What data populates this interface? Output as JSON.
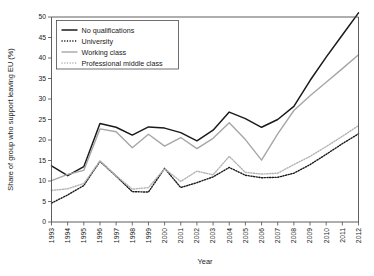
{
  "chart_data": {
    "type": "line",
    "title": "",
    "xlabel": "Year",
    "ylabel": "Share of group who support leaving EU (%)",
    "xlim": [
      1993,
      2012
    ],
    "ylim": [
      0,
      50
    ],
    "yticks": [
      0,
      5,
      10,
      15,
      20,
      25,
      30,
      35,
      40,
      45,
      50
    ],
    "grid": false,
    "legend_position": "top-left",
    "categories": [
      1993,
      1994,
      1995,
      1996,
      1997,
      1998,
      1999,
      2000,
      2001,
      2002,
      2003,
      2004,
      2005,
      2006,
      2007,
      2008,
      2009,
      2010,
      2011,
      2012
    ],
    "x": [
      "1993",
      "1994",
      "1995",
      "1996",
      "1997",
      "1998",
      "1999",
      "2000",
      "2001",
      "2002",
      "2003",
      "2004",
      "2005",
      "2006",
      "2007",
      "2008",
      "2009",
      "2010",
      "2011",
      "2012"
    ],
    "series": [
      {
        "name": "No qualifications",
        "style": "solid",
        "color": "#1a1a1a",
        "width": 1.5,
        "values": [
          13.7,
          11.3,
          13.5,
          24.0,
          23.1,
          21.2,
          23.2,
          22.9,
          21.8,
          19.8,
          22.4,
          26.8,
          25.2,
          23.1,
          25.0,
          28.2,
          34.5,
          40.2,
          45.6,
          51.0
        ]
      },
      {
        "name": "University",
        "style": "dotted",
        "color": "#1a1a1a",
        "width": 1.4,
        "values": [
          4.6,
          6.6,
          8.9,
          14.8,
          11.2,
          7.4,
          7.3,
          13.1,
          8.4,
          9.6,
          11.0,
          13.3,
          11.4,
          10.8,
          10.9,
          11.9,
          14.0,
          16.5,
          19.1,
          21.5
        ]
      },
      {
        "name": "Working class",
        "style": "solid",
        "color": "#a6a6a6",
        "width": 1.4,
        "values": [
          10.1,
          11.6,
          12.6,
          22.7,
          22.0,
          18.1,
          21.4,
          18.5,
          20.6,
          17.9,
          20.4,
          24.2,
          20.1,
          15.1,
          21.5,
          27.2,
          30.8,
          34.1,
          37.4,
          40.8
        ]
      },
      {
        "name": "Professional middle class",
        "style": "dotted",
        "color": "#b3b3b3",
        "width": 1.4,
        "values": [
          7.7,
          8.1,
          9.4,
          14.9,
          11.3,
          8.0,
          8.4,
          13.0,
          9.9,
          12.4,
          11.5,
          16.0,
          12.1,
          11.7,
          11.9,
          14.0,
          16.0,
          18.4,
          20.9,
          23.5
        ]
      }
    ]
  },
  "legend": {
    "items": [
      {
        "label": "No qualifications"
      },
      {
        "label": "University"
      },
      {
        "label": "Working class"
      },
      {
        "label": "Professional middle class"
      }
    ]
  }
}
